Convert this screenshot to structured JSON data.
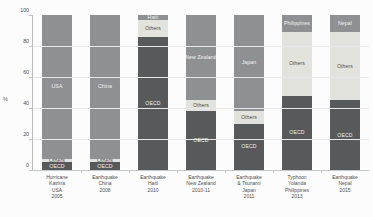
{
  "chart_data": {
    "type": "bar",
    "title": "",
    "subtitle": "",
    "xlabel": "",
    "ylabel": "%",
    "ylim": [
      0,
      100
    ],
    "yticks": [
      0,
      20,
      40,
      60,
      80,
      100
    ],
    "grid": true,
    "legend": "none",
    "stacked": true,
    "note": "100% stacked bar chart of disaster funding/assistance sources by event",
    "categories": [
      "Hurricane Katrina USA 2005",
      "Earthquake China 2008",
      "Earthquake Haiti 2010",
      "Earthquake New Zealand 2010-11",
      "Earthquake & Tsunami Japan 2011",
      "Typhoon Yolanda Philippines 2013",
      "Earthquake Nepal 2015"
    ],
    "series": [
      {
        "name": "OECD",
        "color": "#58595b",
        "values": [
          5,
          5,
          86,
          38,
          30,
          48,
          45
        ]
      },
      {
        "name": "Others",
        "color": "#e3e3dd",
        "values": [
          2,
          2,
          11,
          7,
          8,
          41,
          44
        ]
      },
      {
        "name": "Country",
        "color": "#8f9093",
        "values": [
          93,
          93,
          3,
          55,
          62,
          11,
          11
        ]
      }
    ],
    "bars": [
      {
        "id": "bar-katrina-usa",
        "country_label": "USA",
        "segments": [
          {
            "name": "OECD",
            "label": "OECD",
            "value": 5,
            "from": 0,
            "to": 5,
            "color": "#58595b"
          },
          {
            "name": "Others",
            "label": "Others",
            "value": 2,
            "from": 5,
            "to": 7,
            "color": "#e3e3dd"
          },
          {
            "name": "Country",
            "label": "USA",
            "value": 93,
            "from": 7,
            "to": 100,
            "color": "#8f9093"
          }
        ],
        "xlabel_lines": [
          "Hurricane",
          "Katrina",
          "USA",
          "2005"
        ]
      },
      {
        "id": "bar-earthquake-china",
        "country_label": "China",
        "segments": [
          {
            "name": "OECD",
            "label": "OECD",
            "value": 5,
            "from": 0,
            "to": 5,
            "color": "#58595b"
          },
          {
            "name": "Others",
            "label": "Others",
            "value": 2,
            "from": 5,
            "to": 7,
            "color": "#e3e3dd"
          },
          {
            "name": "Country",
            "label": "China",
            "value": 93,
            "from": 7,
            "to": 100,
            "color": "#8f9093"
          }
        ],
        "xlabel_lines": [
          "Earthquake",
          "China",
          "2008"
        ]
      },
      {
        "id": "bar-earthquake-haiti",
        "country_label": "Haiti",
        "segments": [
          {
            "name": "OECD",
            "label": "OECD",
            "value": 86,
            "from": 0,
            "to": 86,
            "color": "#58595b"
          },
          {
            "name": "Others",
            "label": "Others",
            "value": 11,
            "from": 86,
            "to": 97,
            "color": "#e3e3dd"
          },
          {
            "name": "Country",
            "label": "Haiti",
            "value": 3,
            "from": 97,
            "to": 100,
            "color": "#8f9093"
          }
        ],
        "xlabel_lines": [
          "Earthquake",
          "Haiti",
          "2010"
        ]
      },
      {
        "id": "bar-earthquake-new-zealand",
        "country_label": "New Zealand",
        "segments": [
          {
            "name": "OECD",
            "label": "OECD",
            "value": 38,
            "from": 0,
            "to": 38,
            "color": "#58595b"
          },
          {
            "name": "Others",
            "label": "Others",
            "value": 7,
            "from": 38,
            "to": 45,
            "color": "#e3e3dd"
          },
          {
            "name": "Country",
            "label": "New Zealand",
            "value": 55,
            "from": 45,
            "to": 100,
            "color": "#8f9093"
          }
        ],
        "xlabel_lines": [
          "Earthquake",
          "New Zealand",
          "2010-11"
        ]
      },
      {
        "id": "bar-earthquake-tsunami-japan",
        "country_label": "Japan",
        "segments": [
          {
            "name": "OECD",
            "label": "OECD",
            "value": 30,
            "from": 0,
            "to": 30,
            "color": "#58595b"
          },
          {
            "name": "Others",
            "label": "Others",
            "value": 8,
            "from": 30,
            "to": 38,
            "color": "#e3e3dd"
          },
          {
            "name": "Country",
            "label": "Japan",
            "value": 62,
            "from": 38,
            "to": 100,
            "color": "#8f9093"
          }
        ],
        "xlabel_lines": [
          "Earthquake",
          "& Tsunami",
          "Japan",
          "2011"
        ]
      },
      {
        "id": "bar-typhoon-yolanda-philippines",
        "country_label": "Philippines",
        "segments": [
          {
            "name": "OECD",
            "label": "OECD",
            "value": 48,
            "from": 0,
            "to": 48,
            "color": "#58595b"
          },
          {
            "name": "Others",
            "label": "Others",
            "value": 41,
            "from": 48,
            "to": 89,
            "color": "#e3e3dd"
          },
          {
            "name": "Country",
            "label": "Philippines",
            "value": 11,
            "from": 89,
            "to": 100,
            "color": "#8f9093"
          }
        ],
        "xlabel_lines": [
          "Typhoon",
          "Yolanda",
          "Philippines",
          "2013"
        ]
      },
      {
        "id": "bar-earthquake-nepal",
        "country_label": "Nepal",
        "segments": [
          {
            "name": "OECD",
            "label": "OECD",
            "value": 45,
            "from": 0,
            "to": 45,
            "color": "#58595b"
          },
          {
            "name": "Others",
            "label": "Others",
            "value": 44,
            "from": 45,
            "to": 89,
            "color": "#e3e3dd"
          },
          {
            "name": "Country",
            "label": "Nepal",
            "value": 11,
            "from": 89,
            "to": 100,
            "color": "#8f9093"
          }
        ],
        "xlabel_lines": [
          "Earthquake",
          "Nepal",
          "2015"
        ]
      }
    ]
  },
  "axis": {
    "y_label": "%",
    "y_ticks": [
      "100",
      "80",
      "60",
      "40",
      "20",
      "0"
    ]
  },
  "colors": {
    "oecd": "#58595b",
    "others": "#e3e3dd",
    "country": "#8f9093",
    "background": "#fcfcfc",
    "grid": "#e7e8e9",
    "axis": "#b9bdc0",
    "text": "#4d5155"
  }
}
